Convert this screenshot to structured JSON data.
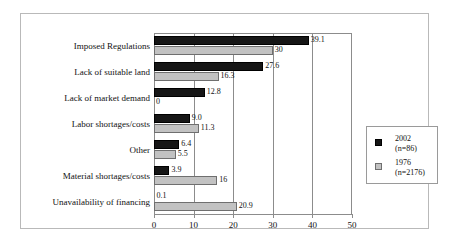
{
  "chart_data": {
    "type": "bar",
    "orientation": "horizontal",
    "title": "",
    "subtitle": "",
    "xlabel": "",
    "ylabel": "",
    "xlim": [
      0,
      50
    ],
    "xticks": [
      0,
      10,
      20,
      30,
      40,
      50
    ],
    "grid": true,
    "grid_axis": "x",
    "legend_position": "right",
    "categories": [
      "Imposed Regulations",
      "Lack of suitable land",
      "Lack of market demand",
      "Labor shortages/costs",
      "Other",
      "Material shortages/costs",
      "Unavailability of financing"
    ],
    "series": [
      {
        "name": "2002",
        "sublabel": "(n=86)",
        "color": "#161616",
        "values": [
          39.1,
          27.6,
          12.8,
          9.0,
          6.4,
          3.9,
          0.1
        ],
        "labels": [
          "39.1",
          "27.6",
          "12.8",
          "9.0",
          "6.4",
          "3.9",
          "0.1"
        ]
      },
      {
        "name": "1976",
        "sublabel": "(n=2176)",
        "color": "#c2c2c2",
        "values": [
          30,
          16.3,
          0,
          11.3,
          5.5,
          16,
          20.9
        ],
        "labels": [
          "30",
          "16.3",
          "0",
          "11.3",
          "5.5",
          "16",
          "20.9"
        ]
      }
    ]
  },
  "legend": {
    "entries": [
      {
        "name": "2002",
        "sublabel": "(n=86)"
      },
      {
        "name": "1976",
        "sublabel": "(n=2176)"
      }
    ]
  },
  "axis": {
    "x_tick_labels": [
      "0",
      "10",
      "20",
      "30",
      "40",
      "50"
    ]
  }
}
